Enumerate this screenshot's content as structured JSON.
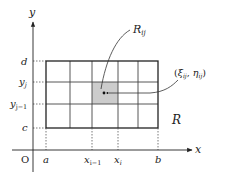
{
  "diagram": {
    "title": "",
    "axes": {
      "x_label": "x",
      "y_label": "y",
      "origin_label": "O"
    },
    "x_ticks": [
      {
        "label": "a",
        "sub": ""
      },
      {
        "label": "x",
        "sub": "i−1"
      },
      {
        "label": "x",
        "sub": "i"
      },
      {
        "label": "b",
        "sub": ""
      }
    ],
    "y_ticks": [
      {
        "label": "d",
        "sub": ""
      },
      {
        "label": "y",
        "sub": "j"
      },
      {
        "label": "y",
        "sub": "j−1"
      },
      {
        "label": "c",
        "sub": ""
      }
    ],
    "region_label": "R",
    "subregion_label": {
      "main": "R",
      "sub": "ij"
    },
    "point_label": {
      "open": "(",
      "xi": "ξ",
      "xi_sub": "ij",
      "sep": ", ",
      "eta": "η",
      "eta_sub": "ij",
      "close": ")"
    },
    "grid": {
      "columns": 5,
      "rows": 3,
      "shaded_cell": {
        "column": 3,
        "row": 2
      }
    },
    "colors": {
      "line": "#222222",
      "grid_line": "#555555",
      "shade": "#cccccc",
      "dotted": "#555555"
    }
  }
}
